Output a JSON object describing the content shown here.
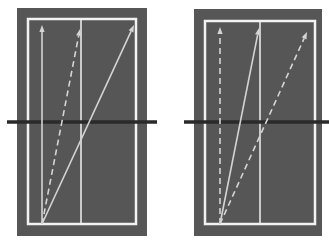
{
  "colors": {
    "background": "#ffffff",
    "panel_fill": "#565656",
    "border": "#f2f2f2",
    "arrow": "#d4d4d4",
    "horizon_line": "#2a2a2a"
  },
  "panels": [
    {
      "id": "left",
      "outer": {
        "x": 17,
        "y": 8,
        "w": 130,
        "h": 228
      },
      "inner": {
        "x": 28,
        "y": 19,
        "w": 108,
        "h": 205
      },
      "divider_x": 81,
      "horizon": {
        "x1": 7,
        "x2": 157,
        "y": 122
      },
      "origin": {
        "x": 42,
        "y": 224
      },
      "arrows": [
        {
          "style": "solid",
          "to": {
            "x": 42,
            "y": 25
          }
        },
        {
          "style": "dashed",
          "to": {
            "x": 80,
            "y": 29
          }
        },
        {
          "style": "solid",
          "to": {
            "x": 134,
            "y": 25
          }
        }
      ]
    },
    {
      "id": "right",
      "outer": {
        "x": 194,
        "y": 9,
        "w": 128,
        "h": 227
      },
      "inner": {
        "x": 205,
        "y": 21,
        "w": 110,
        "h": 203
      },
      "divider_x": 260,
      "horizon": {
        "x1": 184,
        "x2": 329,
        "y": 122
      },
      "origin": {
        "x": 220,
        "y": 224
      },
      "arrows": [
        {
          "style": "dashed",
          "to": {
            "x": 220,
            "y": 27
          }
        },
        {
          "style": "solid",
          "to": {
            "x": 259,
            "y": 28
          }
        },
        {
          "style": "dashed",
          "to": {
            "x": 307,
            "y": 32
          }
        }
      ]
    }
  ]
}
